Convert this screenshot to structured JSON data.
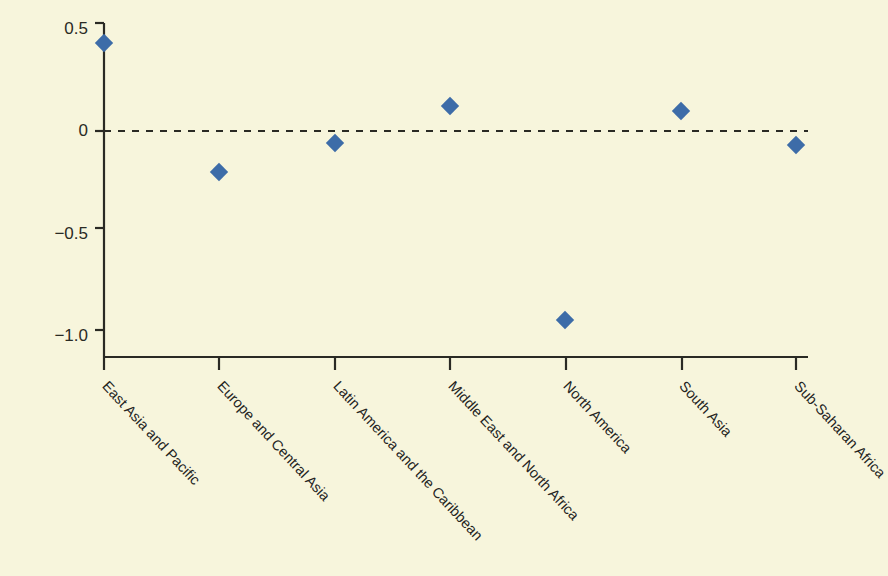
{
  "chart_data": {
    "type": "scatter",
    "title": "",
    "subtitle": "",
    "xlabel": "",
    "ylabel": "",
    "categories": [
      "East Asia and Pacific",
      "Europe and Central Asia",
      "Latin America and the Caribbean",
      "Middle East and North Africa",
      "North America",
      "South Asia",
      "Sub-Saharan Africa"
    ],
    "values": [
      0.43,
      -0.2,
      -0.06,
      0.12,
      -0.92,
      0.1,
      -0.07
    ],
    "series": [
      {
        "name": "",
        "values": [
          0.43,
          -0.2,
          -0.06,
          0.12,
          -0.92,
          0.1,
          -0.07
        ]
      }
    ],
    "ylim": [
      -1.12,
      0.5
    ],
    "yticks": [
      0.5,
      0,
      -0.5,
      -1.0
    ],
    "ytick_labels": [
      "0.5",
      "0",
      "−0.5",
      "−1.0"
    ],
    "grid": false,
    "legend": "none",
    "annotations": [
      {
        "type": "reference-line",
        "axis": "y",
        "value": 0,
        "style": "dashed"
      }
    ],
    "marker": {
      "shape": "diamond",
      "color": "#3d6ca8",
      "size": 13
    },
    "colors": {
      "background": "#f7f5dc",
      "axis": "#2a2a24",
      "marker": "#3d6ca8",
      "zero_line": "#2a2a24",
      "text": "#24241e"
    }
  }
}
